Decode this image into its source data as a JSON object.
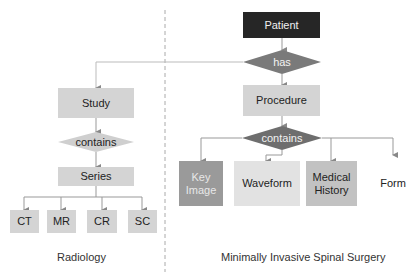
{
  "diagram": {
    "left_section": {
      "caption": "Radiology",
      "study": "Study",
      "relation": "contains",
      "series": "Series",
      "modalities": [
        "CT",
        "MR",
        "CR",
        "SC"
      ]
    },
    "right_section": {
      "caption": "Minimally Invasive Spinal Surgery",
      "patient": "Patient",
      "relation_has": "has",
      "procedure": "Procedure",
      "relation_contains": "contains",
      "children": [
        "Key Image",
        "Waveform",
        "Medical History",
        "Form"
      ]
    },
    "colors": {
      "patient": "#262626",
      "has_diamond": "#7a7a7a",
      "contains_right_diamond": "#6e6e6e",
      "contains_left_diamond": "#cfcfcf",
      "box_light": "#d4d4d4",
      "key_image": "#9a9a9a",
      "connector": "#999999"
    }
  }
}
